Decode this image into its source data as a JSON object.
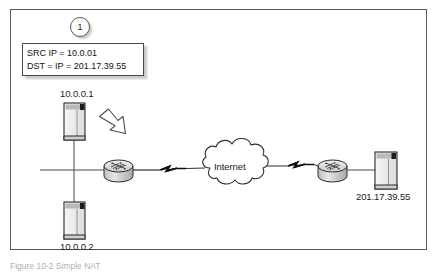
{
  "figure": {
    "caption": "Figure 10-2  Simple NAT",
    "frame_color": "#5a5a5a",
    "background": "#ffffff"
  },
  "badge": {
    "name": "step-1-badge",
    "label": "1"
  },
  "callout": {
    "name": "packet-header-callout",
    "line1": "SRC IP = 10.0.01",
    "line2": "DST = IP = 201.17.39.55"
  },
  "nodes": {
    "host_top": {
      "label": "10.0.0.1",
      "icon": "computer-icon"
    },
    "host_bottom": {
      "label": "10.0.0.2",
      "icon": "computer-icon"
    },
    "router_left": {
      "label": "",
      "icon": "router-icon"
    },
    "router_right": {
      "label": "",
      "icon": "router-icon"
    },
    "cloud": {
      "label": "Internet",
      "icon": "cloud-icon"
    },
    "server_right": {
      "label": "201.17.39.55",
      "icon": "server-icon"
    }
  },
  "annotations": {
    "flow_arrow": "block-arrow-icon",
    "wan_link_left": "lightning-link-icon",
    "wan_link_right": "lightning-link-icon"
  },
  "colors": {
    "line": "#3d3d3d",
    "text": "#1a1a1a",
    "device_fill": "#d8d8d8",
    "device_stroke": "#333333",
    "cloud_stroke": "#2f2f2f"
  }
}
